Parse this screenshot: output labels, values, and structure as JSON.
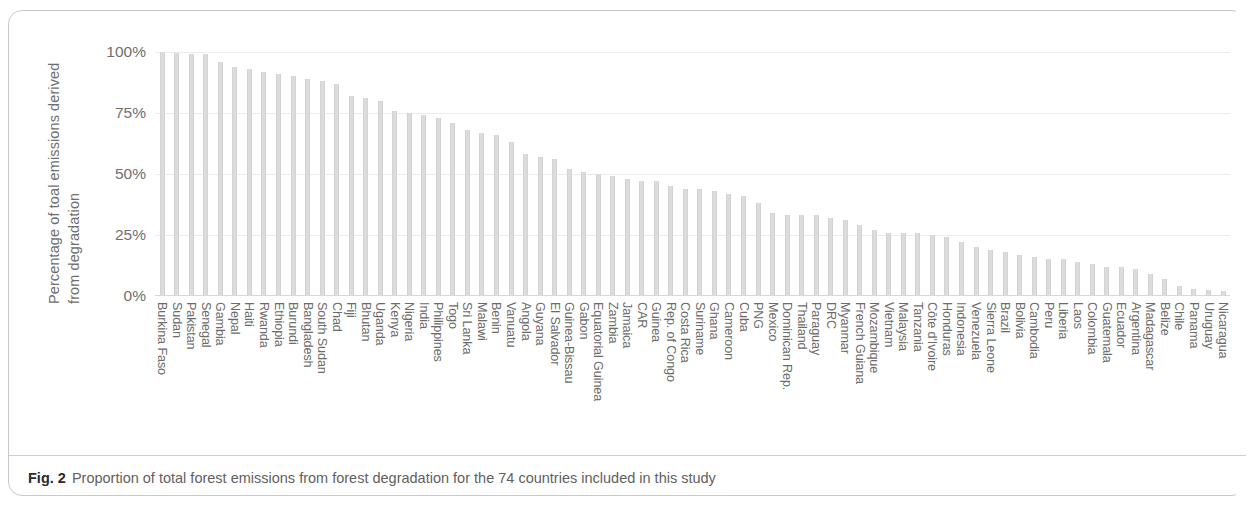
{
  "figure": {
    "caption_number": "Fig. 2",
    "caption_text": "Proportion of total forest emissions from forest degradation for the 74 countries included in this study"
  },
  "axes": {
    "y_title_line1": "Percentage of toal emissions derived",
    "y_title_line2": "from degradation",
    "y_ticks": [
      "100%",
      "75%",
      "50%",
      "25%",
      "0%"
    ]
  },
  "chart_data": {
    "type": "bar",
    "title": "Proportion of total forest emissions from forest degradation for the 74 countries included in this study",
    "xlabel": "",
    "ylabel": "Percentage of toal emissions derived from degradation",
    "ylim": [
      0,
      100
    ],
    "yticks": [
      0,
      25,
      50,
      75,
      100
    ],
    "ytick_labels": [
      "0%",
      "25%",
      "50%",
      "75%",
      "100%"
    ],
    "grid": "horizontal",
    "legend": "none",
    "bar_color": "#dcdcdc",
    "units": "percent",
    "categories": [
      "Burkina Faso",
      "Sudan",
      "Pakistan",
      "Senegal",
      "Gambia",
      "Nepal",
      "Haiti",
      "Rwanda",
      "Ethiopia",
      "Burundi",
      "Bangladesh",
      "South Sudan",
      "Chad",
      "Fiji",
      "Bhutan",
      "Uganda",
      "Kenya",
      "Nigeria",
      "India",
      "Philippines",
      "Togo",
      "Sri Lanka",
      "Malawi",
      "Benin",
      "Vanuatu",
      "Angola",
      "Guyana",
      "El Salvador",
      "Guinea-Bissau",
      "Gabon",
      "Equatorial Guinea",
      "Zambia",
      "Jamaica",
      "CAR",
      "Guinea",
      "Rep. of Congo",
      "Costa Rica",
      "Suriname",
      "Ghana",
      "Cameroon",
      "Cuba",
      "PNG",
      "Mexico",
      "Dominican Rep.",
      "Thailand",
      "Paraguay",
      "DRC",
      "Myanmar",
      "French Guiana",
      "Mozambique",
      "Vietnam",
      "Malaysia",
      "Tanzania",
      "Côte d'Ivoire",
      "Honduras",
      "Indonesia",
      "Venezuela",
      "Sierra Leone",
      "Brazil",
      "Bolivia",
      "Cambodia",
      "Peru",
      "Liberia",
      "Laos",
      "Colombia",
      "Guatemala",
      "Ecuador",
      "Argentina",
      "Madagascar",
      "Belize",
      "Chile",
      "Panama",
      "Uruguay",
      "Nicaragua"
    ],
    "values": [
      100,
      99.5,
      99,
      99,
      96,
      94,
      93,
      92,
      91,
      90,
      89,
      88,
      87,
      82,
      81,
      80,
      76,
      75,
      74,
      73,
      71,
      68,
      67,
      66,
      63,
      58,
      57,
      56,
      52,
      51,
      50,
      49,
      48,
      47,
      47,
      45,
      44,
      44,
      43,
      42,
      41,
      38,
      34,
      33,
      33,
      33,
      32,
      31,
      29,
      27,
      26,
      26,
      26,
      25,
      24,
      22,
      20,
      19,
      18,
      17,
      16,
      15,
      15,
      14,
      13,
      12,
      12,
      11,
      9,
      7,
      4,
      3,
      2.5,
      2
    ]
  }
}
